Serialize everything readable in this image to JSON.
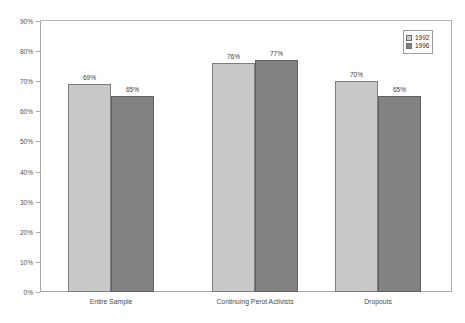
{
  "chart_data": {
    "type": "bar",
    "title": "",
    "subtitle": "",
    "xlabel": "",
    "ylabel": "",
    "categories": [
      "Entire Sample",
      "Continuing Perot Activists",
      "Dropouts"
    ],
    "series": [
      {
        "name": "1992",
        "color": "#c9c9c9",
        "values": [
          69,
          76,
          70
        ],
        "value_labels": [
          "69%",
          "76%",
          "70%"
        ]
      },
      {
        "name": "1996",
        "color": "#828282",
        "values": [
          65,
          77,
          65
        ],
        "value_labels": [
          "65%",
          "77%",
          "65%"
        ]
      }
    ],
    "ylim": [
      0,
      90
    ],
    "y_tick_step": 10,
    "y_tick_labels": [
      "90%",
      "80%",
      "70%",
      "60%",
      "50%",
      "40%",
      "30%",
      "20%",
      "10%",
      "0%"
    ],
    "y_tick_values": [
      90,
      80,
      70,
      60,
      50,
      40,
      30,
      20,
      10,
      0
    ],
    "value_suffix": "%",
    "grid": false,
    "legend_position": "top-right",
    "data_labels_shown": true
  },
  "legend": {
    "entries": [
      {
        "label": "1992",
        "swatch_class": "s1992"
      },
      {
        "label": "1996",
        "swatch_class": "s1996"
      }
    ]
  },
  "colors": {
    "series_1992": "#c9c9c9",
    "series_1996": "#828282",
    "frame": "#a8a8a8",
    "text": "#4a4a4a",
    "background": "#ffffff"
  }
}
